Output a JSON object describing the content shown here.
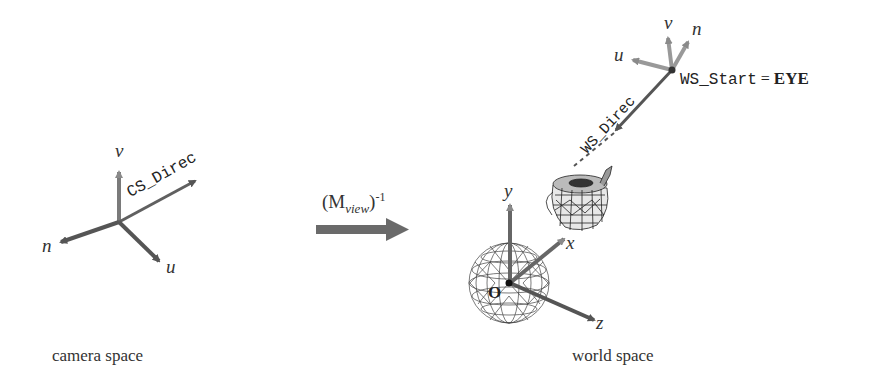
{
  "camera_space": {
    "caption": "camera space",
    "axes": {
      "v": "v",
      "n": "n",
      "u": "u"
    },
    "direction_label": "CS_Direc"
  },
  "transform": {
    "base": "(M",
    "subscript": "view",
    "close": ")",
    "superscript": "-1"
  },
  "world_space": {
    "caption": "world space",
    "axes": {
      "x": "x",
      "y": "y",
      "z": "z"
    },
    "origin_label": "O",
    "eye_axes": {
      "u": "u",
      "v": "v",
      "n": "n"
    },
    "direction_label": "WS_Direc",
    "start_label": "WS_Start",
    "equals": "=",
    "eye_label": "EYE"
  },
  "colors": {
    "axis_dark": "#555555",
    "axis_light": "#8a8a8a",
    "arrow_big": "#666666",
    "wire": "#333333"
  }
}
